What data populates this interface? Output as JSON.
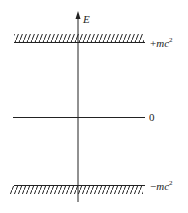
{
  "diagram": {
    "axis_label": "E",
    "levels": [
      {
        "id": "upper",
        "label_sign": "+",
        "label_var": "mc",
        "label_exp": "2",
        "hatched": true,
        "hatch_side": "above"
      },
      {
        "id": "zero",
        "label": "0",
        "hatched": false
      },
      {
        "id": "lower",
        "label_sign": "−",
        "label_var": "mc",
        "label_exp": "2",
        "hatched": true,
        "hatch_side": "below"
      }
    ],
    "colors": {
      "line": "#222222",
      "background": "#ffffff"
    }
  }
}
